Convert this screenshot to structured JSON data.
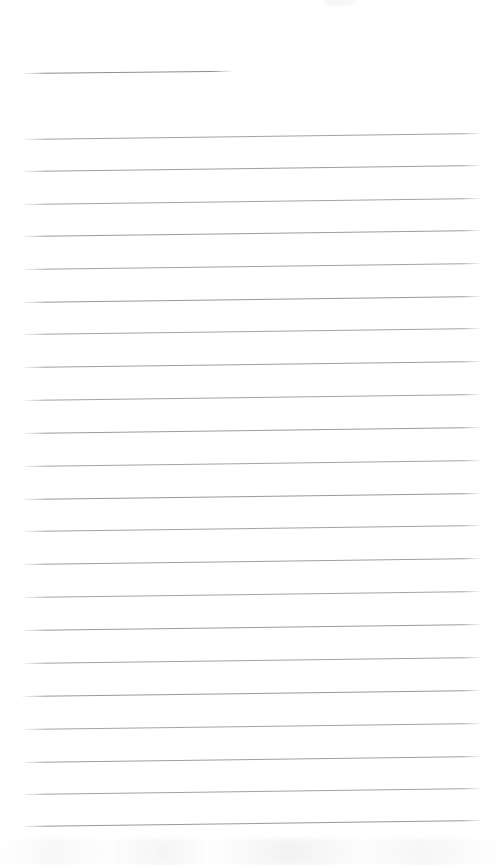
{
  "document": {
    "kind": "scanned-ruled-notepad-page",
    "title": "",
    "body_text": "",
    "width_px": 501,
    "height_px": 865,
    "background_color": "#ffffff",
    "rule_color": "#a0a0a4",
    "short_rule_color": "#8e8e92",
    "orientation": "portrait",
    "is_blank": true
  },
  "layout": {
    "left_margin_px": 20,
    "right_edge_px": 482,
    "first_rule_y_px": 139,
    "rule_spacing_px": 32.5,
    "rule_tilt_deg": -0.75,
    "rule_thickness_px": 1
  },
  "short_rule": {
    "label": "header-underline",
    "x_start_px": 20,
    "x_end_px": 233,
    "y_px": 73,
    "length_px": 213,
    "tilt_deg": -0.6,
    "color": "#8e8e92"
  },
  "rules": [
    {
      "index": 1,
      "y_px": 139,
      "x_start_px": 20,
      "x_end_px": 482,
      "color": "#a2a2a6"
    },
    {
      "index": 2,
      "y_px": 171,
      "x_start_px": 20,
      "x_end_px": 482,
      "color": "#9e9ea2"
    },
    {
      "index": 3,
      "y_px": 204,
      "x_start_px": 20,
      "x_end_px": 482,
      "color": "#a4a4a8"
    },
    {
      "index": 4,
      "y_px": 236,
      "x_start_px": 20,
      "x_end_px": 482,
      "color": "#9c9ca0"
    },
    {
      "index": 5,
      "y_px": 269,
      "x_start_px": 20,
      "x_end_px": 482,
      "color": "#a2a2a6"
    },
    {
      "index": 6,
      "y_px": 302,
      "x_start_px": 20,
      "x_end_px": 482,
      "color": "#9a9a9e"
    },
    {
      "index": 7,
      "y_px": 334,
      "x_start_px": 20,
      "x_end_px": 482,
      "color": "#a4a4a8"
    },
    {
      "index": 8,
      "y_px": 367,
      "x_start_px": 20,
      "x_end_px": 482,
      "color": "#9e9ea2"
    },
    {
      "index": 9,
      "y_px": 400,
      "x_start_px": 20,
      "x_end_px": 482,
      "color": "#a2a2a6"
    },
    {
      "index": 10,
      "y_px": 433,
      "x_start_px": 20,
      "x_end_px": 482,
      "color": "#9c9ca0"
    },
    {
      "index": 11,
      "y_px": 466,
      "x_start_px": 20,
      "x_end_px": 482,
      "color": "#a4a4a8"
    },
    {
      "index": 12,
      "y_px": 499,
      "x_start_px": 20,
      "x_end_px": 482,
      "color": "#9a9a9e"
    },
    {
      "index": 13,
      "y_px": 531,
      "x_start_px": 20,
      "x_end_px": 482,
      "color": "#a2a2a6"
    },
    {
      "index": 14,
      "y_px": 564,
      "x_start_px": 20,
      "x_end_px": 482,
      "color": "#9e9ea2"
    },
    {
      "index": 15,
      "y_px": 597,
      "x_start_px": 20,
      "x_end_px": 482,
      "color": "#a4a4a8"
    },
    {
      "index": 16,
      "y_px": 630,
      "x_start_px": 20,
      "x_end_px": 482,
      "color": "#9c9ca0"
    },
    {
      "index": 17,
      "y_px": 663,
      "x_start_px": 20,
      "x_end_px": 482,
      "color": "#a2a2a6"
    },
    {
      "index": 18,
      "y_px": 696,
      "x_start_px": 20,
      "x_end_px": 482,
      "color": "#9a9a9e"
    },
    {
      "index": 19,
      "y_px": 729,
      "x_start_px": 20,
      "x_end_px": 482,
      "color": "#a4a4a8"
    },
    {
      "index": 20,
      "y_px": 762,
      "x_start_px": 20,
      "x_end_px": 482,
      "color": "#9e9ea2"
    },
    {
      "index": 21,
      "y_px": 794,
      "x_start_px": 20,
      "x_end_px": 482,
      "color": "#a2a2a6"
    },
    {
      "index": 22,
      "y_px": 826,
      "x_start_px": 20,
      "x_end_px": 482,
      "color": "#9a9a9e"
    }
  ]
}
